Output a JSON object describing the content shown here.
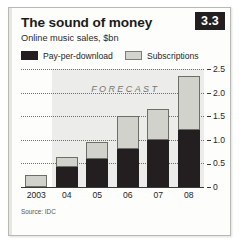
{
  "figure": {
    "badge": "3.3",
    "title": "The sound of money",
    "subtitle": "Online music sales, $bn",
    "source": "Source: IDC",
    "forecast_label": "FORECAST"
  },
  "colors": {
    "pay_per_download": "#231f20",
    "subscriptions": "#d2d2cd",
    "badge_bg": "#231f20",
    "badge_text": "#ffffff",
    "forecast_band": "#ececea",
    "frame_border": "#b9b9b4"
  },
  "chart_data": {
    "type": "bar",
    "stacked": true,
    "title": "The sound of money",
    "subtitle": "Online music sales, $bn",
    "xlabel": "",
    "ylabel": "$bn",
    "categories": [
      "2003",
      "04",
      "05",
      "06",
      "07",
      "08"
    ],
    "series": [
      {
        "name": "Pay-per-download",
        "values": [
          0.0,
          0.42,
          0.6,
          0.8,
          1.0,
          1.2
        ]
      },
      {
        "name": "Subscriptions",
        "values": [
          0.25,
          0.22,
          0.35,
          0.7,
          0.65,
          1.15
        ]
      }
    ],
    "totals": [
      0.25,
      0.64,
      0.95,
      1.5,
      1.65,
      2.35
    ],
    "ylim": [
      0,
      2.5
    ],
    "yticks": [
      "0",
      "0.5",
      "1.0",
      "1.5",
      "2.0",
      "2.5"
    ],
    "ytick_values": [
      0,
      0.5,
      1.0,
      1.5,
      2.0,
      2.5
    ],
    "grid": true,
    "legend_position": "top",
    "annotations": [
      {
        "text": "FORECAST",
        "from_category": "04",
        "to_category": "08"
      }
    ],
    "source": "Source: IDC"
  }
}
